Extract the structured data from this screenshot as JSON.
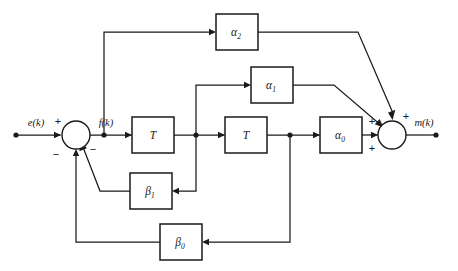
{
  "diagram": {
    "type": "signal-flow-block-diagram",
    "background_color": "#ffffff",
    "line_color": "#1a1a1a",
    "signals": {
      "input": "e(k)",
      "intermediate": "f(k)",
      "output": "m(k)"
    },
    "blocks": [
      {
        "id": "alpha2",
        "label": "α",
        "subscript": "2",
        "x": 216,
        "y": 14,
        "w": 42,
        "h": 36
      },
      {
        "id": "alpha1",
        "label": "α",
        "subscript": "1",
        "x": 251,
        "y": 67,
        "w": 42,
        "h": 36
      },
      {
        "id": "delay1",
        "label": "T",
        "subscript": "",
        "x": 132,
        "y": 117,
        "w": 42,
        "h": 36
      },
      {
        "id": "delay2",
        "label": "T",
        "subscript": "",
        "x": 225,
        "y": 117,
        "w": 42,
        "h": 36
      },
      {
        "id": "alpha0",
        "label": "α",
        "subscript": "0",
        "x": 320,
        "y": 117,
        "w": 42,
        "h": 36
      },
      {
        "id": "beta1",
        "label": "β",
        "subscript": "1",
        "x": 130,
        "y": 173,
        "w": 42,
        "h": 36
      },
      {
        "id": "beta0",
        "label": "β",
        "subscript": "0",
        "x": 160,
        "y": 224,
        "w": 42,
        "h": 36
      }
    ],
    "adders": [
      {
        "id": "input-adder",
        "cx": 76,
        "cy": 135,
        "r": 14,
        "signs": [
          {
            "value": "+",
            "x": 58,
            "y": 122,
            "port": "left-input"
          },
          {
            "value": "−",
            "x": 93,
            "y": 150,
            "port": "lower-right-input"
          },
          {
            "value": "−",
            "x": 56,
            "y": 155,
            "port": "lower-left-input"
          }
        ]
      },
      {
        "id": "output-adder",
        "cx": 392,
        "cy": 135,
        "r": 14,
        "signs": [
          {
            "value": "+",
            "x": 406,
            "y": 117,
            "port": "top-input"
          },
          {
            "value": "+",
            "x": 372,
            "y": 122,
            "port": "upper-left-input"
          },
          {
            "value": "+",
            "x": 372,
            "y": 149,
            "port": "lower-left-input"
          }
        ]
      }
    ],
    "labels": [
      {
        "id": "input-label",
        "text": "e(k)",
        "x": 36,
        "y": 124
      },
      {
        "id": "intermediate-label",
        "text": "f(k)",
        "x": 106,
        "y": 124
      },
      {
        "id": "output-label",
        "text": "m(k)",
        "x": 424,
        "y": 124
      }
    ],
    "nodes": [
      {
        "id": "node-fk",
        "x": 104,
        "y": 135
      },
      {
        "id": "node-after-delay1",
        "x": 196,
        "y": 135
      },
      {
        "id": "node-after-delay2",
        "x": 290,
        "y": 135
      },
      {
        "id": "terminal-input",
        "x": 16,
        "y": 135
      },
      {
        "id": "terminal-output",
        "x": 436,
        "y": 135
      }
    ]
  }
}
